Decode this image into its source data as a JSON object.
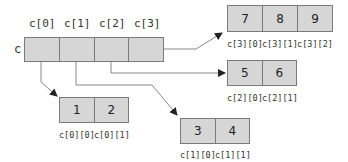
{
  "main_array": {
    "name": "c",
    "headers": [
      "c[0]",
      "c[1]",
      "c[2]",
      "c[3]"
    ]
  },
  "rows": [
    {
      "index": 0,
      "values": [
        "1",
        "2"
      ],
      "labels": [
        "c[0][0]",
        "c[0][1]"
      ]
    },
    {
      "index": 1,
      "values": [
        "3",
        "4"
      ],
      "labels": [
        "c[1][0]",
        "c[1][1]"
      ]
    },
    {
      "index": 2,
      "values": [
        "5",
        "6"
      ],
      "labels": [
        "c[2][0]",
        "c[2][1]"
      ]
    },
    {
      "index": 3,
      "values": [
        "7",
        "8",
        "9"
      ],
      "labels": [
        "c[3][0]",
        "c[3][1]",
        "c[3][2]"
      ]
    }
  ],
  "colors": {
    "cell_fill": "#d6d6d6",
    "cell_border": "#7a7a7a",
    "arrow": "#555555"
  }
}
